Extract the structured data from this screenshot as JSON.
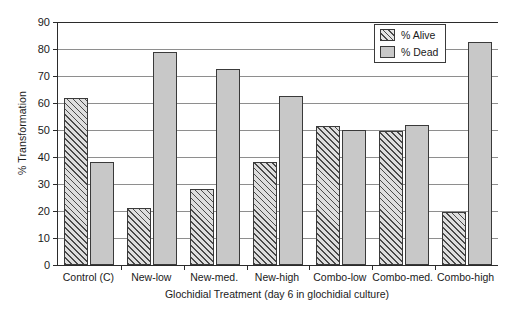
{
  "chart_data": {
    "type": "bar",
    "title": "",
    "xlabel": "Glochidial Treatment (day 6 in glochidial culture)",
    "ylabel": "% Transformation",
    "ylim": [
      0,
      90
    ],
    "ytick_step": 10,
    "yticks": [
      0,
      10,
      20,
      30,
      40,
      50,
      60,
      70,
      80,
      90
    ],
    "ytick_labels": [
      "0",
      "10",
      "20",
      "30",
      "40",
      "50",
      "60",
      "70",
      "80",
      "90"
    ],
    "grid": "horizontal",
    "legend_position": "top-right-inside",
    "categories": [
      "Control (C)",
      "New-low",
      "New-med.",
      "New-high",
      "Combo-low",
      "Combo-med.",
      "Combo-high"
    ],
    "series": [
      {
        "name": "% Alive",
        "pattern": "diagonal-hatch",
        "color": "#dedede",
        "values": [
          62,
          21,
          28,
          38,
          51.5,
          49.5,
          19.5
        ]
      },
      {
        "name": "% Dead",
        "pattern": "solid",
        "color": "#c8c8c8",
        "values": [
          38,
          79,
          72.5,
          62.5,
          50,
          52,
          82.5
        ]
      }
    ]
  },
  "legend": {
    "entries": [
      {
        "label": "% Alive"
      },
      {
        "label": "% Dead"
      }
    ]
  },
  "colors": {
    "axis": "#2b2b2b",
    "gridline": "#8e8e8e",
    "dead_fill": "#c8c8c8",
    "alive_fill": "#dedede",
    "background": "#ffffff"
  }
}
